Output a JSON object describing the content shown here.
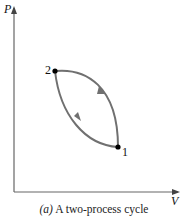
{
  "diagram": {
    "y_axis_label": "P",
    "x_axis_label": "V",
    "points": [
      {
        "id": "1",
        "label": "1"
      },
      {
        "id": "2",
        "label": "2"
      }
    ],
    "caption_prefix": "(a)",
    "caption_text": "A two-process cycle",
    "colors": {
      "curve": "#6e6e6e",
      "axis": "#555555",
      "point": "#000000"
    }
  }
}
